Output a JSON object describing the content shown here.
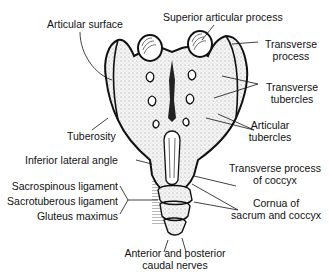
{
  "diagram": {
    "labels": {
      "articular_surface": "Articular surface",
      "superior_articular_process": "Superior articular process",
      "transverse_process_l1": "Transverse",
      "transverse_process_l2": "process",
      "transverse_tubercles_l1": "Transverse",
      "transverse_tubercles_l2": "tubercles",
      "articular_tubercles_l1": "Articular",
      "articular_tubercles_l2": "tubercles",
      "tuberosity": "Tuberosity",
      "inferior_lateral_angle": "Inferior lateral angle",
      "transverse_process_coccyx_l1": "Transverse process",
      "transverse_process_coccyx_l2": "of coccyx",
      "cornua_l1": "Cornua of",
      "cornua_l2": "sacrum and coccyx",
      "sacrospinous_ligament": "Sacrospinous ligament",
      "sacrotuberous_ligament": "Sacrotuberous ligament",
      "gluteus_maximus": "Gluteus maximus",
      "caudal_nerves_l1": "Anterior and posterior",
      "caudal_nerves_l2": "caudal nerves"
    }
  }
}
